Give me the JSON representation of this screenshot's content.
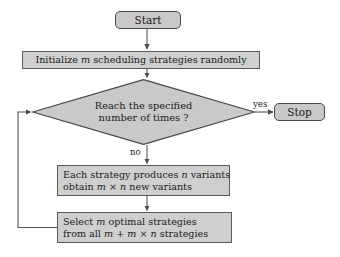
{
  "diagram": {
    "colors": {
      "node_fill": "#c9c9c9",
      "process_fill": "#cfcfcf",
      "node_border": "#4a4a4a",
      "connector": "#555555",
      "text": "#1a1a1a"
    },
    "nodes": {
      "start": {
        "label": "Start",
        "shape": "terminator"
      },
      "initialize": {
        "line1_pre": "Initialize ",
        "line1_var": "m",
        "line1_post": " scheduling strategies randomly",
        "shape": "process"
      },
      "decision": {
        "line1": "Reach the specified",
        "line2": "number of times ?",
        "shape": "decision"
      },
      "stop": {
        "label": "Stop",
        "shape": "terminator"
      },
      "variants": {
        "l1_a": "Each strategy produces ",
        "l1_var": "n",
        "l1_b": " variants",
        "l2_a": "obtain ",
        "l2_var1": "m",
        "l2_mid": " × ",
        "l2_var2": "n",
        "l2_b": " new variants",
        "shape": "process"
      },
      "select": {
        "l1_a": "Select ",
        "l1_var": "m",
        "l1_b": " optimal strategies",
        "l2_a": "from all ",
        "l2_var1": "m",
        "l2_plus": " + ",
        "l2_var2": "m",
        "l2_mid": " × ",
        "l2_var3": "n",
        "l2_b": " strategies",
        "shape": "process"
      }
    },
    "edges": {
      "yes_label": "yes",
      "no_label": "no"
    }
  }
}
